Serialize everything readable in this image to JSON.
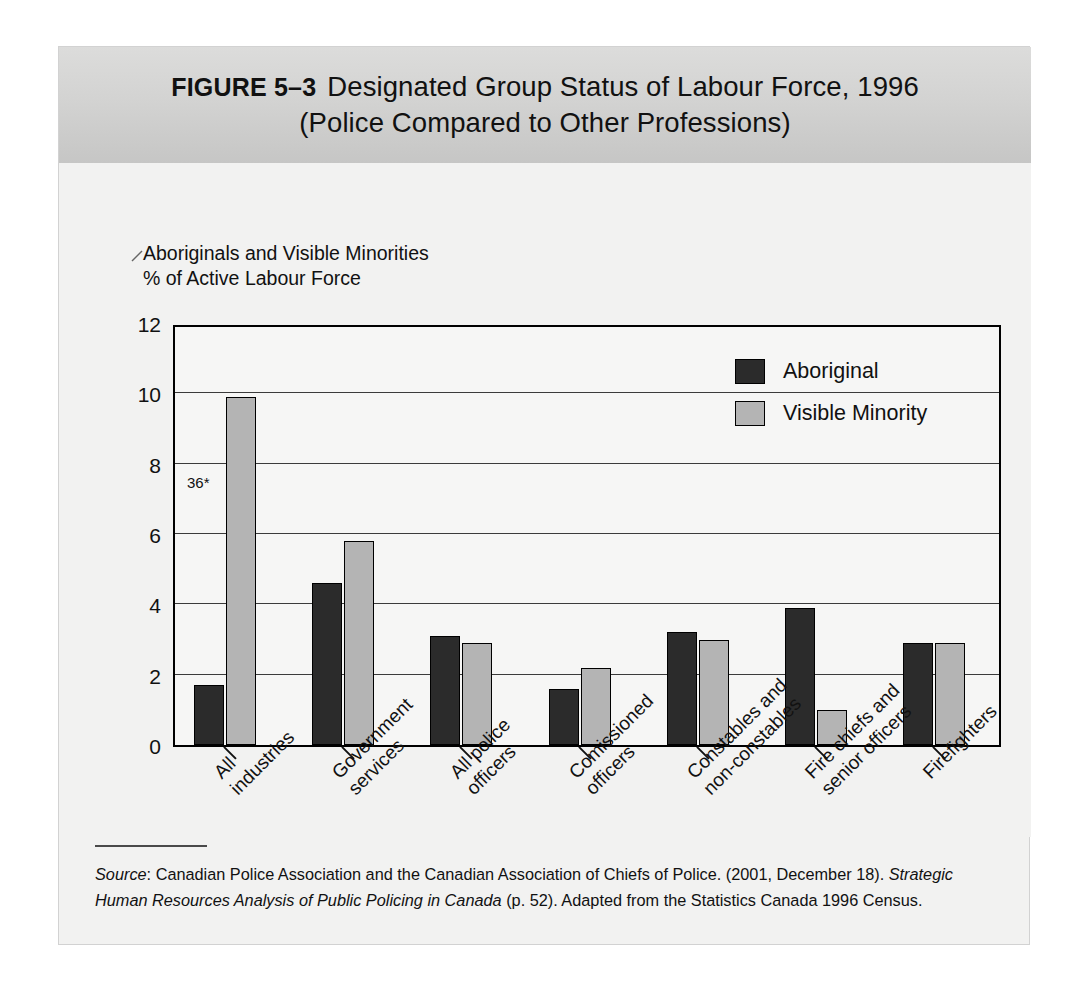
{
  "figure": {
    "label": "FIGURE 5–3",
    "title_line1": "Designated Group Status of Labour Force, 1996",
    "title_line2": "(Police Compared to Other Professions)"
  },
  "axis": {
    "y_caption_line1": "Aboriginals and Visible Minorities",
    "y_caption_line2": "% of Active Labour Force",
    "annotation": "36*"
  },
  "legend": {
    "items": [
      {
        "label": "Aboriginal",
        "color": "#2b2b2b"
      },
      {
        "label": "Visible Minority",
        "color": "#b4b4b4"
      }
    ]
  },
  "source": {
    "prefix": "Source",
    "text": ": Canadian Police Association and the Canadian Association of Chiefs of Police. (2001, December 18). ",
    "italic1": "Strategic Human Resources Analysis of Public Policing in Canada",
    "tail": " (p. 52). Adapted from the Statistics Canada 1996 Census."
  },
  "chart_data": {
    "type": "bar",
    "title": "Designated Group Status of Labour Force, 1996 (Police Compared to Other Professions)",
    "xlabel": "",
    "ylabel": "Aboriginals and Visible Minorities % of Active Labour Force",
    "ylim": [
      0,
      12
    ],
    "yticks": [
      0,
      2,
      4,
      6,
      8,
      10,
      12
    ],
    "grid": true,
    "legend_position": "top-right",
    "annotations": [
      {
        "text": "36*",
        "x_category": "All industries",
        "y": 7.5
      }
    ],
    "categories": [
      [
        "All",
        "industries"
      ],
      [
        "Government",
        "services"
      ],
      [
        "All police",
        "officers"
      ],
      [
        "Comissioned",
        "officers"
      ],
      [
        "Constables and",
        "non-constables"
      ],
      [
        "Fire chiefs and",
        "senior officers"
      ],
      [
        "Firefighters"
      ]
    ],
    "series": [
      {
        "name": "Aboriginal",
        "color": "#2b2b2b",
        "values": [
          1.7,
          4.6,
          3.1,
          1.6,
          3.2,
          3.9,
          2.9
        ]
      },
      {
        "name": "Visible Minority",
        "color": "#b4b4b4",
        "values": [
          9.9,
          5.8,
          2.9,
          2.2,
          3.0,
          1.0,
          2.9
        ]
      }
    ]
  }
}
